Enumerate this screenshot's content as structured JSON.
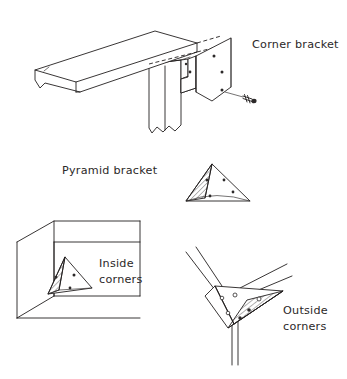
{
  "figure": {
    "background_color": "#ffffff",
    "line_color": "#221f1f",
    "text_color": "#2b2828",
    "width": 347,
    "height": 379
  },
  "labels": {
    "corner_bracket": "Corner bracket",
    "pyramid_bracket": "Pyramid bracket",
    "inside_corners_line1": "Inside",
    "inside_corners_line2": "corners",
    "outside_corners_line1": "Outside",
    "outside_corners_line2": "corners"
  },
  "diagrams": [
    {
      "id": "corner-bracket-assembly",
      "label": "Corner bracket",
      "parts": [
        "horizontal beam",
        "vertical post",
        "L-shaped metal bracket plate",
        "screw"
      ],
      "bracket_hole_count": 6,
      "has_hidden_dashed_edges": true,
      "has_broken_ends": true
    },
    {
      "id": "pyramid-bracket",
      "label": "Pyramid bracket",
      "parts": [
        "triangular pyramid plate"
      ],
      "bracket_hole_count": 4,
      "hatched_faces": 1
    },
    {
      "id": "inside-corners",
      "label": "Inside corners",
      "parts": [
        "room inside corner walls",
        "triangular bracket"
      ],
      "bracket_hole_count": 3,
      "hatched_faces": 1
    },
    {
      "id": "outside-corners",
      "label": "Outside corners",
      "parts": [
        "three radiating beams",
        "triangular bracket"
      ],
      "bracket_hole_count": 6,
      "hatched_faces": 1
    }
  ]
}
